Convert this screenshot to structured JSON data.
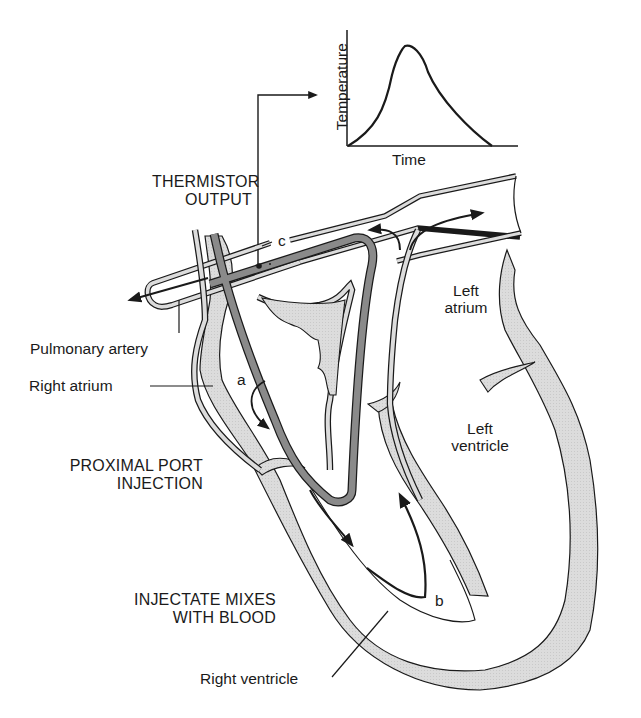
{
  "figure": {
    "colors": {
      "myocardium_fill": "#d9d9d9",
      "catheter_fill": "#8a8a8a",
      "outline": "#1a1a1a",
      "background": "#ffffff"
    }
  },
  "inset_graph": {
    "y_axis_label": "Temperature",
    "x_axis_label": "Time",
    "curve_shape": "single peak with skewed tail (thermodilution curve)"
  },
  "labels": {
    "thermistor_output": [
      "THERMISTOR",
      "OUTPUT"
    ],
    "pulmonary_artery": "Pulmonary artery",
    "right_atrium": "Right atrium",
    "left_atrium": [
      "Left",
      "atrium"
    ],
    "left_ventricle": [
      "Left",
      "ventricle"
    ],
    "proximal_port_injection": [
      "PROXIMAL PORT",
      "INJECTION"
    ],
    "injectate_mixes": [
      "INJECTATE MIXES",
      "WITH BLOOD"
    ],
    "right_ventricle": "Right ventricle",
    "point_a": "a",
    "point_b": "b",
    "point_c": "c"
  }
}
